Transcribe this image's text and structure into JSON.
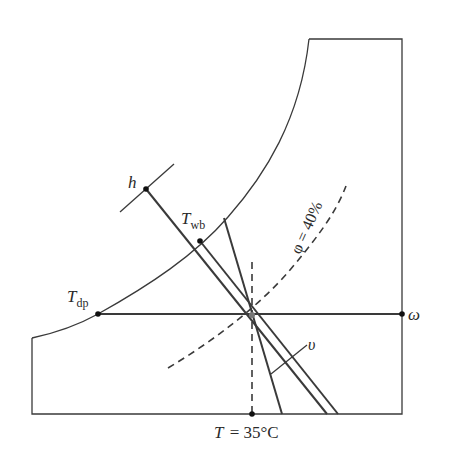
{
  "diagram": {
    "labels": {
      "h": "h",
      "twb_main": "T",
      "twb_sub": "wb",
      "tdp_main": "T",
      "tdp_sub": "dp",
      "phi": "φ = 40%",
      "omega": "ω",
      "v": "υ",
      "temperature": "T = 35°C"
    },
    "state": {
      "dry_bulb_temperature": "35°C",
      "relative_humidity": "40%"
    },
    "colors": {
      "line": "#3a3a3a",
      "text": "#2a2a2a",
      "background": "#ffffff"
    }
  }
}
